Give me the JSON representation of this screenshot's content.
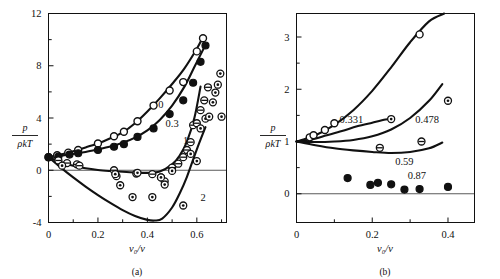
{
  "figure": {
    "panels": [
      {
        "id": "a",
        "caption": "(a)",
        "ylabel_num": "p",
        "ylabel_den": "ρkT",
        "xlabel": "v₀/v",
        "xticks": [
          "0",
          "0.2",
          "0.4",
          "0.6"
        ],
        "yticks": [
          "-4",
          "0",
          "4",
          "8",
          "12"
        ],
        "curve_labels": [
          "0",
          "0.3",
          "1",
          "2"
        ]
      },
      {
        "id": "b",
        "caption": "(b)",
        "ylabel_num": "p",
        "ylabel_den": "ρkT",
        "xlabel": "v₀/v",
        "xticks": [
          "0",
          "0.2",
          "0.4"
        ],
        "yticks": [
          "0",
          "1",
          "2",
          "3"
        ],
        "curve_labels": [
          "0.331",
          "0.478",
          "0.59",
          "0.87"
        ]
      }
    ]
  },
  "chart_data": [
    {
      "type": "line",
      "title": "",
      "panel": "a",
      "xlabel": "v0/v",
      "ylabel": "p/rho k T",
      "xlim": [
        0,
        0.72
      ],
      "ylim": [
        -4,
        12
      ],
      "xticks": [
        0,
        0.2,
        0.4,
        0.6
      ],
      "yticks": [
        -4,
        0,
        4,
        8,
        12
      ],
      "xminor": [
        0.1,
        0.3,
        0.5,
        0.7
      ],
      "yminor": [
        -2,
        2,
        6,
        10
      ],
      "grid": false,
      "zero_line": 0,
      "legend": "inline-curve-labels",
      "series": [
        {
          "name": "0",
          "label": "0",
          "label_at": [
            0.455,
            5.05
          ],
          "marker": "open-circle",
          "x": [
            0.0,
            0.035,
            0.08,
            0.12,
            0.2,
            0.265,
            0.305,
            0.36,
            0.425,
            0.49,
            0.545,
            0.6,
            0.625
          ],
          "y": [
            1.0,
            1.15,
            1.35,
            1.55,
            2.05,
            2.6,
            2.95,
            3.75,
            4.95,
            6.1,
            6.75,
            9.1,
            10.1
          ],
          "curve_x": [
            0.0,
            0.05,
            0.1,
            0.15,
            0.2,
            0.25,
            0.3,
            0.35,
            0.4,
            0.45,
            0.5,
            0.55,
            0.6,
            0.625
          ],
          "curve_y": [
            1.0,
            1.2,
            1.45,
            1.75,
            2.05,
            2.45,
            2.9,
            3.6,
            4.5,
            5.5,
            6.6,
            7.8,
            9.3,
            10.2
          ]
        },
        {
          "name": "0.3",
          "label": "0.3",
          "label_at": [
            0.5,
            3.55
          ],
          "marker": "filled-circle",
          "x": [
            0.0,
            0.04,
            0.085,
            0.12,
            0.2,
            0.265,
            0.305,
            0.36,
            0.425,
            0.49,
            0.545,
            0.585,
            0.615,
            0.635
          ],
          "y": [
            1.0,
            1.05,
            1.2,
            1.3,
            1.55,
            1.8,
            2.0,
            2.55,
            3.2,
            4.3,
            5.35,
            6.7,
            8.3,
            9.55
          ],
          "curve_x": [
            0.0,
            0.05,
            0.1,
            0.15,
            0.2,
            0.25,
            0.3,
            0.35,
            0.4,
            0.45,
            0.5,
            0.55,
            0.59,
            0.635
          ],
          "curve_y": [
            1.0,
            1.1,
            1.25,
            1.4,
            1.6,
            1.82,
            2.1,
            2.5,
            3.05,
            3.85,
            4.95,
            6.4,
            7.9,
            9.6
          ]
        },
        {
          "name": "1",
          "label": "1",
          "label_at": [
            0.555,
            2.25
          ],
          "marker": "circle-bar",
          "x": [
            0.04,
            0.075,
            0.115,
            0.125,
            0.265,
            0.275,
            0.355,
            0.42,
            0.455,
            0.47,
            0.5,
            0.525,
            0.545,
            0.56,
            0.575,
            0.585,
            0.6,
            0.615,
            0.63,
            0.645
          ],
          "y": [
            0.75,
            0.55,
            0.45,
            0.35,
            0.0,
            -0.45,
            -0.25,
            -0.3,
            -0.55,
            -0.85,
            0.2,
            0.5,
            1.0,
            1.55,
            2.15,
            3.45,
            3.6,
            4.6,
            5.35,
            6.35
          ],
          "curve_x": [
            0.0,
            0.05,
            0.1,
            0.15,
            0.2,
            0.25,
            0.3,
            0.35,
            0.4,
            0.45,
            0.5,
            0.53,
            0.56,
            0.59,
            0.615
          ],
          "curve_y": [
            1.0,
            0.62,
            0.35,
            0.15,
            0.02,
            -0.06,
            -0.12,
            -0.17,
            -0.2,
            -0.1,
            0.45,
            1.1,
            2.2,
            4.0,
            6.4
          ]
        },
        {
          "name": "2",
          "label": "2",
          "label_at": [
            0.625,
            -2.05
          ],
          "marker": "circle-dot",
          "x": [
            0.055,
            0.27,
            0.29,
            0.34,
            0.36,
            0.42,
            0.455,
            0.47,
            0.5,
            0.545,
            0.575,
            0.6,
            0.615,
            0.635,
            0.65,
            0.665,
            0.675,
            0.685,
            0.695,
            0.7
          ],
          "y": [
            0.35,
            -0.3,
            -1.15,
            -2.05,
            -0.2,
            -2.05,
            -0.55,
            -1.1,
            -0.05,
            -2.7,
            1.25,
            0.7,
            3.2,
            3.95,
            4.1,
            5.2,
            5.95,
            6.55,
            7.4,
            4.1
          ],
          "curve_x": [
            0.0,
            0.05,
            0.1,
            0.15,
            0.2,
            0.25,
            0.3,
            0.35,
            0.4,
            0.43,
            0.46,
            0.5,
            0.53,
            0.56,
            0.6,
            0.635
          ],
          "curve_y": [
            1.0,
            0.2,
            -0.55,
            -1.25,
            -1.9,
            -2.5,
            -3.05,
            -3.5,
            -3.8,
            -3.85,
            -3.7,
            -2.85,
            -1.8,
            -0.5,
            1.6,
            3.3
          ]
        }
      ]
    },
    {
      "type": "line",
      "title": "",
      "panel": "b",
      "xlabel": "v0/v",
      "ylabel": "p/rho k T",
      "xlim": [
        0,
        0.47
      ],
      "ylim": [
        -0.55,
        3.45
      ],
      "xticks": [
        0,
        0.2,
        0.4
      ],
      "yticks": [
        0,
        1,
        2,
        3
      ],
      "xminor": [
        0.1,
        0.3
      ],
      "yminor": [
        0.5,
        1.5,
        2.5
      ],
      "grid": false,
      "zero_line": 0,
      "legend": "inline-curve-labels",
      "series": [
        {
          "name": "0.331",
          "label": "0.331",
          "label_at": [
            0.145,
            1.42
          ],
          "marker": "open-circle",
          "x": [
            0.035,
            0.045,
            0.075,
            0.1,
            0.325
          ],
          "y": [
            1.08,
            1.12,
            1.22,
            1.35,
            3.05
          ],
          "curve_x": [
            0.0,
            0.05,
            0.1,
            0.15,
            0.2,
            0.25,
            0.3,
            0.35,
            0.39
          ],
          "curve_y": [
            1.0,
            1.12,
            1.32,
            1.6,
            1.97,
            2.42,
            2.9,
            3.3,
            3.45
          ]
        },
        {
          "name": "0.478",
          "label": "0.478",
          "label_at": [
            0.345,
            1.42
          ],
          "marker": "circle-dot",
          "x": [
            0.25,
            0.4
          ],
          "y": [
            1.43,
            1.78
          ],
          "curve_x": [
            0.0,
            0.04,
            0.08,
            0.12,
            0.16,
            0.2,
            0.235,
            0.25
          ],
          "curve_y": [
            1.0,
            1.04,
            1.12,
            1.2,
            1.29,
            1.36,
            1.42,
            1.44
          ]
        },
        {
          "name": "0.59",
          "label": "0.59",
          "label_at": [
            0.285,
            0.62
          ],
          "marker": "circle-bar",
          "x": [
            0.22,
            0.33
          ],
          "y": [
            0.88,
            1.0
          ],
          "curve_x": [
            0.0,
            0.05,
            0.1,
            0.15,
            0.2,
            0.25,
            0.3,
            0.35,
            0.385
          ],
          "curve_y": [
            1.0,
            0.99,
            1.0,
            1.03,
            1.1,
            1.23,
            1.45,
            1.78,
            2.1
          ]
        },
        {
          "name": "0.87",
          "label": "0.87",
          "label_at": [
            0.318,
            0.35
          ],
          "marker": "filled-circle",
          "x": [
            0.135,
            0.195,
            0.215,
            0.25,
            0.285,
            0.325,
            0.4
          ],
          "y": [
            0.3,
            0.17,
            0.21,
            0.18,
            0.08,
            0.09,
            0.13
          ],
          "curve_x": [
            0.0,
            0.05,
            0.1,
            0.15,
            0.2,
            0.25,
            0.3,
            0.35,
            0.385
          ],
          "curve_y": [
            1.0,
            0.93,
            0.87,
            0.83,
            0.8,
            0.78,
            0.8,
            0.87,
            0.98
          ]
        }
      ]
    }
  ]
}
